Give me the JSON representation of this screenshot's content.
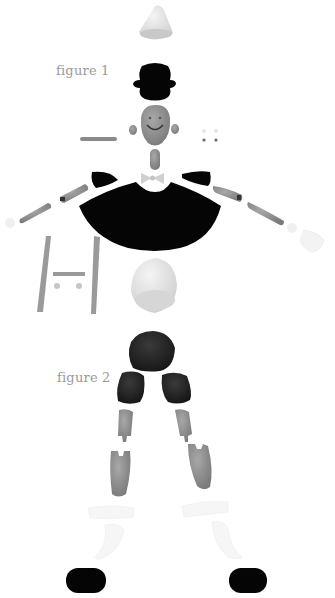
{
  "labels": {
    "figure1": "figure 1",
    "figure2": "figure 2"
  },
  "colors": {
    "background": "#ffffff",
    "clay_gray": "#8c8c8c",
    "clay_light": "#d6d6d6",
    "clay_white": "#f2f2f2",
    "black": "#050505",
    "dark": "#2a2a2a",
    "label": "#9a9a9a"
  },
  "parts": {
    "figure1": [
      "nose-cone",
      "top-hat",
      "head",
      "ears",
      "eyebrow",
      "eyes",
      "neck",
      "bow-tie",
      "shoulders",
      "cape",
      "upper-arms",
      "forearms",
      "hands",
      "legs-frame",
      "crossbar",
      "buttons",
      "egg-body"
    ],
    "figure2": [
      "hips",
      "thighs",
      "knees",
      "shins",
      "socks",
      "shoes"
    ]
  }
}
